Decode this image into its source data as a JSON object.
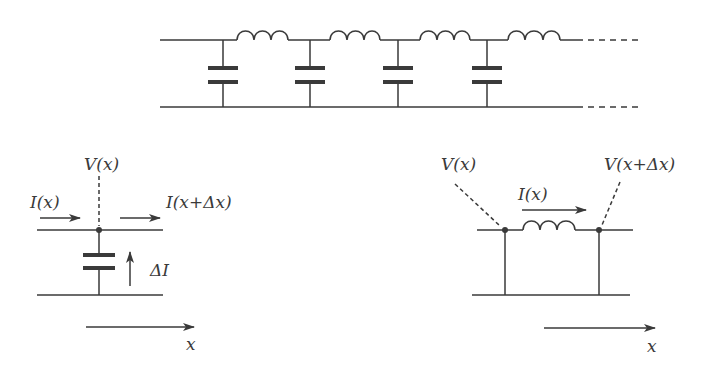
{
  "diagram": {
    "colors": {
      "stroke": "#3a3a3a",
      "background": "#ffffff"
    },
    "top_ladder": {
      "sections": 4,
      "components": [
        "capacitor",
        "inductor",
        "capacitor",
        "inductor",
        "capacitor",
        "inductor",
        "capacitor",
        "inductor"
      ],
      "continues": "dashed"
    },
    "left_detail": {
      "labels": {
        "voltage": "V(x)",
        "current_in": "I(x)",
        "current_out": "I(x+Δx)",
        "delta_current": "ΔI",
        "axis": "x"
      },
      "component": "capacitor"
    },
    "right_detail": {
      "labels": {
        "voltage_left": "V(x)",
        "voltage_right": "V(x+Δx)",
        "current": "I(x)",
        "axis": "x"
      },
      "component": "inductor"
    }
  }
}
